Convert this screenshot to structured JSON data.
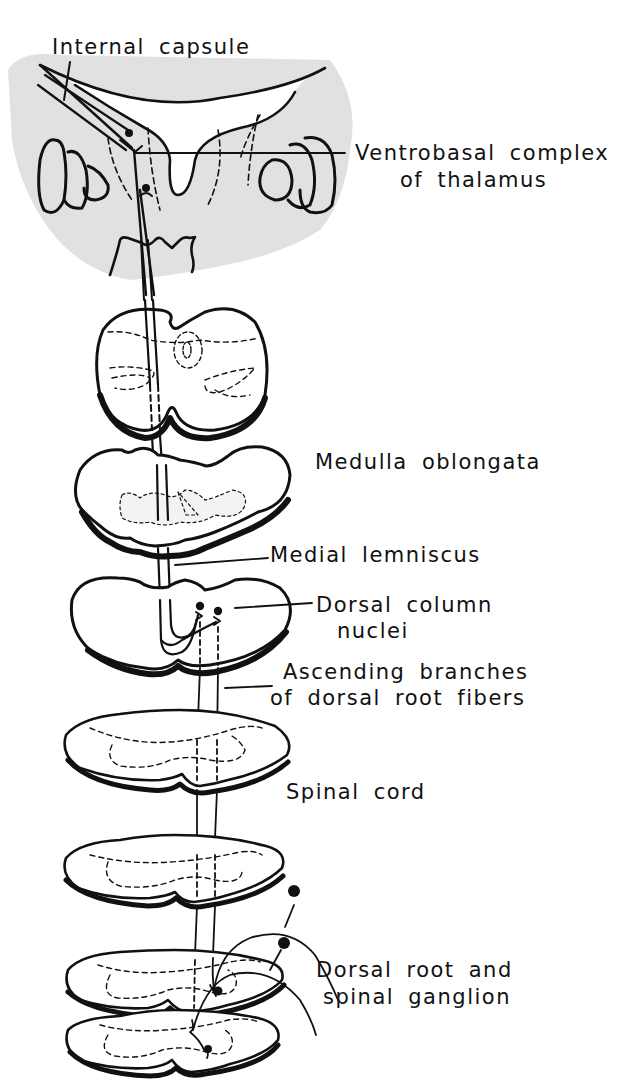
{
  "diagram": {
    "type": "anatomical-pathway",
    "colors": {
      "ink": "#111111",
      "paper": "#ffffff",
      "shade": "#dcdcdc"
    },
    "labels": {
      "internal_capsule": "Internal capsule",
      "ventrobasal_line1": "Ventrobasal complex",
      "ventrobasal_line2": "of thalamus",
      "medulla": "Medulla oblongata",
      "medial_lemniscus": "Medial lemniscus",
      "dorsal_column_line1": "Dorsal column",
      "dorsal_column_line2": "nuclei",
      "ascending_line1": "Ascending branches",
      "ascending_line2": "of dorsal root fibers",
      "spinal_cord": "Spinal cord",
      "dorsal_root_line1": "Dorsal root and",
      "dorsal_root_line2": "spinal ganglion"
    },
    "sections": [
      {
        "name": "thalamus-section"
      },
      {
        "name": "pons-section"
      },
      {
        "name": "upper-medulla-section"
      },
      {
        "name": "lower-medulla-section"
      },
      {
        "name": "spinal-section-1"
      },
      {
        "name": "spinal-section-2"
      },
      {
        "name": "spinal-section-3"
      },
      {
        "name": "spinal-section-4"
      }
    ]
  }
}
